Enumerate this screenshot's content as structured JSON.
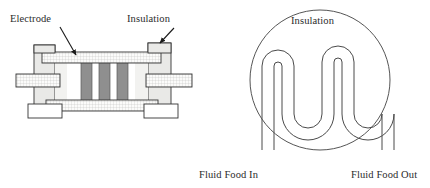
{
  "figure": {
    "title_absent": true,
    "panels": [
      {
        "id": "left-panel",
        "name": "parallel-plate-electrode-chamber-cross-section",
        "labels": [
          {
            "id": "electrode",
            "text": "Electrode",
            "x": 10,
            "y": 14
          },
          {
            "id": "insulation",
            "text": "Insulation",
            "x": 127,
            "y": 14
          }
        ],
        "annotations": {
          "electrode_arrow": {
            "from": [
              60,
              27
            ],
            "to": [
              76,
              56
            ]
          },
          "insulation_arrow": {
            "from": [
              173,
              29
            ],
            "to": [
              159,
              44
            ]
          }
        },
        "components": {
          "electrode_bars_count": 3,
          "electrode_bar_fill": "#8f8f8f",
          "insulation_block_fill": "#e9e9e7",
          "plate_fill": "#f7f7f5",
          "outline_color": "#333333"
        }
      },
      {
        "id": "right-panel",
        "name": "circular-serpentine-tube-holding-section",
        "labels": [
          {
            "id": "insulation",
            "text": "Insulation",
            "x": 291,
            "y": 16
          },
          {
            "id": "fluid-food-in",
            "text": "Fluid Food In",
            "x": 199,
            "y": 170
          },
          {
            "id": "fluid-food-out",
            "text": "Fluid Food Out",
            "x": 351,
            "y": 170
          }
        ],
        "components": {
          "circle_center": [
            320,
            80
          ],
          "circle_radius": 70,
          "serpentine_top_bends": 3,
          "serpentine_bottom_bends": 2,
          "tube_stroke": "#4a4a4a",
          "circle_stroke": "#555555"
        }
      }
    ]
  },
  "colors": {
    "background": "#ffffff",
    "ink": "#2b2b2b",
    "outline": "#333333",
    "electrode_gray": "#8f8f8f",
    "insulation_gray": "#e9e9e7",
    "plate_light": "#f7f7f5",
    "hatch": "#b9b9b9"
  }
}
